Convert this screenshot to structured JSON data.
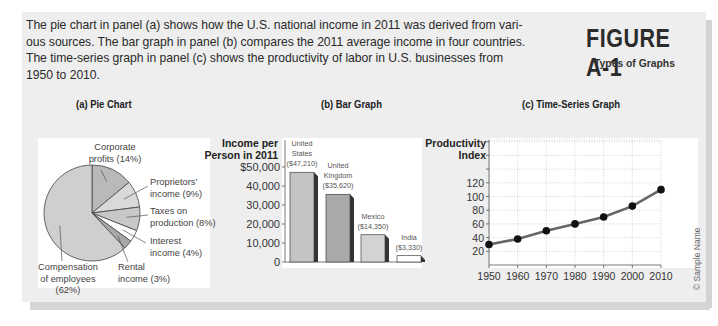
{
  "figure": {
    "label": "FIGURE A-1",
    "subtitle": "Types of Graphs",
    "intro_lines": [
      "The pie chart in panel (a) shows how the U.S. national income in 2011 was derived from vari-",
      "ous sources. The bar graph in panel (b) compares the 2011 average income in four countries.",
      "The time-series graph in panel (c) shows the productivity of labor in U.S. businesses from",
      "1950 to 2010."
    ],
    "credit": "© Sample Name"
  },
  "panels": {
    "a": {
      "title": "(a) Pie Chart"
    },
    "b": {
      "title": "(b) Bar Graph"
    },
    "c": {
      "title": "(c) Time-Series Graph"
    }
  },
  "chart_data": [
    {
      "type": "pie",
      "title": "(a) Pie Chart",
      "slices": [
        {
          "label_lines": [
            "Corporate",
            "profits (14%)"
          ],
          "value": 14,
          "color": "#b9b9b9"
        },
        {
          "label_lines": [
            "Proprietors’",
            "income (9%)"
          ],
          "value": 9,
          "color": "#d9d9d9"
        },
        {
          "label_lines": [
            "Taxes on",
            "production (8%)"
          ],
          "value": 8,
          "color": "#c8c8c8"
        },
        {
          "label_lines": [
            "Interest",
            "income (4%)"
          ],
          "value": 4,
          "color": "#ffffff"
        },
        {
          "label_lines": [
            "Rental",
            "income (3%)"
          ],
          "value": 3,
          "color": "#a8a8a8"
        },
        {
          "label_lines": [
            "Compensation",
            "of employees",
            "(62%)"
          ],
          "value": 62,
          "color": "#cfcfcf"
        }
      ]
    },
    {
      "type": "bar",
      "title": "(b) Bar Graph",
      "ylabel_lines": [
        "Income per",
        "Person in 2011"
      ],
      "yticks": [
        "$50,000",
        "40,000",
        "30,000",
        "20,000",
        "10,000",
        "0"
      ],
      "ylim": [
        0,
        50000
      ],
      "categories": [
        "United States",
        "United Kingdom",
        "Mexico",
        "India"
      ],
      "category_label_lines": [
        [
          "United",
          "States",
          "($47,210)"
        ],
        [
          "United",
          "Kingdom",
          "($35,620)"
        ],
        [
          "Mexico",
          "($14,350)"
        ],
        [
          "India",
          "($3,330)"
        ]
      ],
      "values": [
        47210,
        35620,
        14350,
        3330
      ],
      "colors": [
        "#c4c4c4",
        "#a9a9a9",
        "#d3d3d3",
        "#ffffff"
      ]
    },
    {
      "type": "line",
      "title": "(c) Time-Series Graph",
      "ylabel_lines": [
        "Productivity",
        "Index"
      ],
      "x": [
        1950,
        1960,
        1970,
        1980,
        1990,
        2000,
        2010
      ],
      "xticks": [
        "1950",
        "1960",
        "1970",
        "1980",
        "1990",
        "2000",
        "2010"
      ],
      "yticks": [
        "120",
        "100",
        "80",
        "60",
        "40",
        "20"
      ],
      "series": [
        {
          "name": "Productivity Index",
          "values": [
            30,
            38,
            50,
            60,
            70,
            86,
            110
          ],
          "color": "#666666"
        }
      ],
      "ylim": [
        0,
        170
      ],
      "grid": true
    }
  ]
}
